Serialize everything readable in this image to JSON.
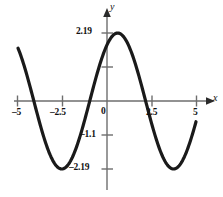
{
  "figure": {
    "title": "",
    "axis_labels": {
      "x": "x",
      "y": "y"
    },
    "colors": {
      "axis": "#6e6e6e",
      "curve": "#1a1a1a",
      "text": "#111111"
    }
  },
  "chart_data": {
    "type": "line",
    "title": "",
    "xlabel": "x",
    "ylabel": "y",
    "xlim": [
      -5.6,
      5.6
    ],
    "ylim": [
      -2.6,
      2.6
    ],
    "grid": false,
    "legend": null,
    "xticks": [
      -5,
      -2.5,
      0,
      2.5,
      5
    ],
    "xticklabels": [
      "–5",
      "–2.5",
      "0",
      "2.5",
      "5"
    ],
    "yticks": [
      2.19,
      1.1,
      -1.1,
      -2.19
    ],
    "yticklabels": [
      "2.19",
      "",
      "–1.1",
      "–2.19"
    ],
    "amplitude": 2.19,
    "period": 6.28,
    "zeros": [
      -4.41,
      -0.84,
      2.27
    ],
    "maxima": [
      {
        "x": 0.6,
        "y": 2.19
      }
    ],
    "minima": [
      {
        "x": -2.7,
        "y": -2.19
      },
      {
        "x": 3.7,
        "y": -2.19
      }
    ],
    "x": [
      -5.0,
      -4.75,
      -4.5,
      -4.25,
      -4.0,
      -3.75,
      -3.5,
      -3.25,
      -3.0,
      -2.75,
      -2.5,
      -2.25,
      -2.0,
      -1.75,
      -1.5,
      -1.25,
      -1.0,
      -0.75,
      -0.5,
      -0.25,
      0.0,
      0.25,
      0.5,
      0.75,
      1.0,
      1.25,
      1.5,
      1.75,
      2.0,
      2.25,
      2.5,
      2.75,
      3.0,
      3.25,
      3.5,
      3.75,
      4.0,
      4.25,
      4.5,
      4.75,
      5.0
    ],
    "values": [
      1.28,
      0.79,
      0.26,
      -0.28,
      -0.8,
      -1.27,
      -1.68,
      -1.98,
      -2.14,
      -2.19,
      -2.1,
      -1.87,
      -1.51,
      -1.06,
      -0.54,
      0.01,
      0.56,
      1.07,
      1.52,
      1.88,
      2.11,
      2.19,
      2.17,
      1.98,
      1.68,
      1.26,
      0.77,
      0.24,
      -0.3,
      -0.82,
      -1.29,
      -1.7,
      -1.99,
      -2.15,
      -2.19,
      -2.09,
      -1.85,
      -1.49,
      -1.04,
      -0.52,
      0.0
    ]
  },
  "labels": {
    "x_minus5": "–5",
    "x_minus25": "–2.5",
    "x_zero": "0",
    "x_25": "2.5",
    "x_5": "5",
    "y_219": "2.19",
    "y_minus11": "–1.1",
    "y_minus219": "–2.19",
    "axis_x": "x",
    "axis_y": "y"
  }
}
